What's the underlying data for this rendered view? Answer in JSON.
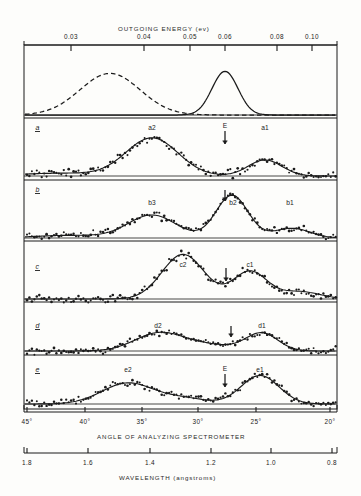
{
  "figure": {
    "top_axis": {
      "title": "OUTGOING  ENERGY  (ev)",
      "ticks": [
        {
          "label": "0.03",
          "x": 71
        },
        {
          "label": "0.04",
          "x": 144
        },
        {
          "label": "0.05",
          "x": 190
        },
        {
          "label": "0.06",
          "x": 225
        },
        {
          "label": "0.08",
          "x": 277
        },
        {
          "label": "0.10",
          "x": 312
        }
      ]
    },
    "angle_axis": {
      "title": "ANGLE  OF  ANALYZING  SPECTROMETER",
      "ticks": [
        {
          "label": "45°",
          "x": 27
        },
        {
          "label": "40°",
          "x": 85
        },
        {
          "label": "35°",
          "x": 142
        },
        {
          "label": "30°",
          "x": 198
        },
        {
          "label": "25°",
          "x": 256
        },
        {
          "label": "20°",
          "x": 330
        }
      ]
    },
    "wavelength_axis": {
      "title": "WAVELENGTH  (angstroms)",
      "ticks": [
        {
          "label": "1.8",
          "x": 27
        },
        {
          "label": "1.6",
          "x": 88
        },
        {
          "label": "1.4",
          "x": 150
        },
        {
          "label": "1.2",
          "x": 211
        },
        {
          "label": "1.0",
          "x": 271
        },
        {
          "label": "0.8",
          "x": 332
        }
      ]
    },
    "panels": [
      {
        "id": "top",
        "label": "",
        "peaks": [],
        "arrow": null
      },
      {
        "id": "a",
        "label": "a",
        "peaks": [
          {
            "text": "a2",
            "x": 152
          },
          {
            "text": "a1",
            "x": 265
          }
        ],
        "arrow": {
          "x": 225,
          "label": "E"
        }
      },
      {
        "id": "b",
        "label": "b",
        "peaks": [
          {
            "text": "b3",
            "x": 152
          },
          {
            "text": "b2",
            "x": 232
          },
          {
            "text": "b1",
            "x": 290
          }
        ],
        "arrow": {
          "x": 225,
          "label": ""
        }
      },
      {
        "id": "c",
        "label": "c",
        "peaks": [
          {
            "text": "c2",
            "x": 183
          },
          {
            "text": "c1",
            "x": 250
          }
        ],
        "arrow": {
          "x": 226,
          "label": ""
        }
      },
      {
        "id": "d",
        "label": "d",
        "peaks": [
          {
            "text": "d2",
            "x": 158
          },
          {
            "text": "d1",
            "x": 262
          }
        ],
        "arrow": {
          "x": 231,
          "label": ""
        }
      },
      {
        "id": "e",
        "label": "e",
        "peaks": [
          {
            "text": "e2",
            "x": 128
          },
          {
            "text": "e1",
            "x": 260
          }
        ],
        "arrow": {
          "x": 225,
          "label": "E"
        }
      }
    ]
  },
  "chart_data": {
    "type": "scatter",
    "xlabel": "ANGLE OF ANALYZING SPECTROMETER",
    "ylabel": "Counts (arbitrary units)",
    "x_top_label": "OUTGOING ENERGY (ev)",
    "x_bottom_label": "WAVELENGTH (angstroms)",
    "grid": false,
    "legend": "none",
    "axis_ranges": {
      "angle_deg": [
        45,
        20
      ],
      "energy_ev": [
        0.025,
        0.105
      ],
      "wavelength_angstrom": [
        1.8,
        0.8
      ]
    },
    "panels": [
      {
        "id": "top",
        "description": "Incident spectrum: dashed resolution curve and solid monochromatic peak",
        "series": [
          {
            "name": "dashed-gaussian",
            "style": "dashed",
            "peak_x": 110,
            "peak_height": 0.8,
            "sigma": 30
          },
          {
            "name": "solid-gaussian",
            "style": "solid",
            "peak_x": 225,
            "peak_height": 0.84,
            "sigma": 13
          }
        ]
      },
      {
        "id": "a",
        "peaks": [
          {
            "name": "a2",
            "x": 152,
            "relative_height": 1.0
          },
          {
            "name": "a1",
            "x": 265,
            "relative_height": 0.4
          }
        ],
        "arrow_energy_marker": {
          "name": "E",
          "x": 225
        }
      },
      {
        "id": "b",
        "peaks": [
          {
            "name": "b3",
            "x": 152,
            "relative_height": 0.58
          },
          {
            "name": "b2",
            "x": 232,
            "relative_height": 1.0
          },
          {
            "name": "b1",
            "x": 290,
            "relative_height": 0.22
          }
        ],
        "arrow_energy_marker": {
          "name": "",
          "x": 225
        }
      },
      {
        "id": "c",
        "peaks": [
          {
            "name": "c2",
            "x": 183,
            "relative_height": 1.0
          },
          {
            "name": "c1",
            "x": 250,
            "relative_height": 0.62
          }
        ],
        "arrow_energy_marker": {
          "name": "",
          "x": 226
        }
      },
      {
        "id": "d",
        "peaks": [
          {
            "name": "d2",
            "x": 158,
            "relative_height": 0.62
          },
          {
            "name": "d1",
            "x": 262,
            "relative_height": 0.66
          }
        ],
        "arrow_energy_marker": {
          "name": "",
          "x": 231
        }
      },
      {
        "id": "e",
        "peaks": [
          {
            "name": "e2",
            "x": 128,
            "relative_height": 0.72
          },
          {
            "name": "e1",
            "x": 260,
            "relative_height": 1.0
          }
        ],
        "arrow_energy_marker": {
          "name": "E",
          "x": 225
        }
      }
    ]
  }
}
